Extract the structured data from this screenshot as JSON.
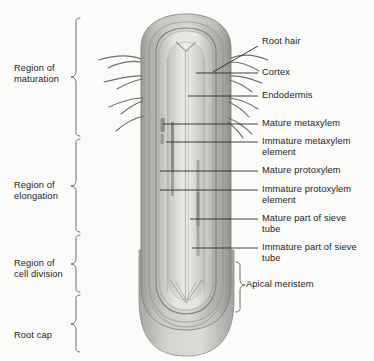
{
  "figure": {
    "background_color": "#fbfbfa",
    "ink_color": "#1d1d1d"
  },
  "regions": [
    {
      "id": "maturation",
      "label": "Region of\nmaturation",
      "bracket_top": 18,
      "bracket_bottom": 136
    },
    {
      "id": "elongation",
      "label": "Region of\nelongation",
      "bracket_top": 137,
      "bracket_bottom": 232
    },
    {
      "id": "cell-division",
      "label": "Region of\ncell division",
      "bracket_top": 233,
      "bracket_bottom": 292
    },
    {
      "id": "root-cap",
      "label": "Root cap",
      "bracket_top": 293,
      "bracket_bottom": 352
    }
  ],
  "structures": [
    {
      "id": "root-hair",
      "label": "Root hair",
      "text_y": 41,
      "leader": "diagonal",
      "leader_from_x": 213,
      "leader_from_y": 72,
      "leader_to_x": 258,
      "leader_to_y": 46
    },
    {
      "id": "cortex",
      "label": "Cortex",
      "text_y": 69,
      "leader": "straight",
      "leader_from_x": 196,
      "leader_from_y": 73,
      "leader_to_x": 258,
      "leader_to_y": 73
    },
    {
      "id": "endodermis",
      "label": "Endodermis",
      "text_y": 92,
      "leader": "straight",
      "leader_from_x": 188,
      "leader_from_y": 96,
      "leader_to_x": 258,
      "leader_to_y": 96
    },
    {
      "id": "mature-metaxylem",
      "label": "Mature metaxylem",
      "text_y": 120,
      "leader": "straight",
      "leader_from_x": 165,
      "leader_from_y": 124,
      "leader_to_x": 258,
      "leader_to_y": 124
    },
    {
      "id": "immature-metaxylem",
      "label": "Immature metaxylem\nelement",
      "text_y": 138,
      "leader": "straight",
      "leader_from_x": 168,
      "leader_from_y": 142,
      "leader_to_x": 258,
      "leader_to_y": 142
    },
    {
      "id": "mature-protoxylem",
      "label": "Mature protoxylem",
      "text_y": 167,
      "leader": "straight",
      "leader_from_x": 160,
      "leader_from_y": 171,
      "leader_to_x": 258,
      "leader_to_y": 171
    },
    {
      "id": "immature-protoxylem",
      "label": "Immature protoxylem\nelement",
      "text_y": 186,
      "leader": "straight",
      "leader_from_x": 160,
      "leader_from_y": 190,
      "leader_to_x": 258,
      "leader_to_y": 190
    },
    {
      "id": "mature-sieve-tube",
      "label": "Mature part of sieve\ntube",
      "text_y": 215,
      "leader": "straight",
      "leader_from_x": 188,
      "leader_from_y": 219,
      "leader_to_x": 258,
      "leader_to_y": 219
    },
    {
      "id": "immature-sieve-tube",
      "label": "Immature part of sieve\ntube",
      "text_y": 244,
      "leader": "straight",
      "leader_from_x": 190,
      "leader_from_y": 248,
      "leader_to_x": 258,
      "leader_to_y": 248
    }
  ],
  "apical_meristem": {
    "label": "Apical meristem",
    "bracket_top": 262,
    "bracket_bottom": 312,
    "text_y": 283
  },
  "anatomy": {
    "epidermis_color": "#b3b3b1",
    "cortex_color": "#c9c9c6",
    "stele_color": "#d9d9d6",
    "vascular_color": "#a8a8a5",
    "rootcap_color": "#cfcfcb",
    "outline_color": "#8a8a87"
  }
}
